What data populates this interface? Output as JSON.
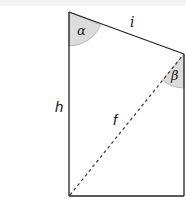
{
  "diagram": {
    "type": "quadrilateral-geometry",
    "shape": "right trapezoid with diagonal",
    "labels": {
      "side_top": "i",
      "side_left": "h",
      "diagonal": "f",
      "angle_top_left": "α",
      "angle_top_right": "β"
    },
    "colors": {
      "stroke": "#222222",
      "angle_fill": "#dcdcdc"
    }
  }
}
